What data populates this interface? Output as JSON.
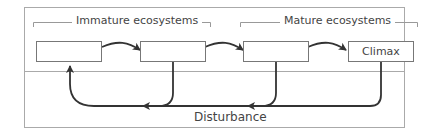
{
  "diagram": {
    "groups": [
      {
        "label": "Immature ecosystems"
      },
      {
        "label": "Mature ecosystems"
      }
    ],
    "nodes": [
      {
        "label": ""
      },
      {
        "label": ""
      },
      {
        "label": ""
      },
      {
        "label": "Climax"
      }
    ],
    "feedback_label": "Disturbance",
    "colors": {
      "line": "#333333",
      "border": "#777777",
      "bracket": "#999999"
    }
  }
}
